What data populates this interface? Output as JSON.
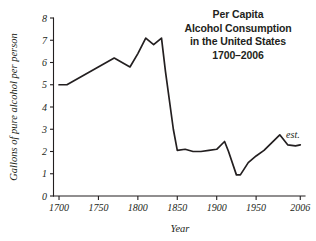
{
  "figure": {
    "width": 316,
    "height": 241,
    "background": "#ffffff",
    "ink_color": "#231f20"
  },
  "title": {
    "line1": "Per Capita",
    "line2": "Alcohol Consumption",
    "line3": "in the United States",
    "line4": "1700–2006"
  },
  "annotations": {
    "estimate_label": "est."
  },
  "chart_data": {
    "type": "line",
    "title": "Per Capita Alcohol Consumption in the United States 1700–2006",
    "xlabel": "Year",
    "ylabel": "Gallons of pure alcohol per person",
    "xlim": [
      1693,
      2012
    ],
    "ylim": [
      0,
      8
    ],
    "xticks": [
      1700,
      1750,
      1800,
      1850,
      1900,
      1950,
      2006
    ],
    "xtick_labels": [
      "1700",
      "1750",
      "1800",
      "1850",
      "1900",
      "1950",
      "2006"
    ],
    "yticks": [
      0,
      1,
      2,
      3,
      4,
      5,
      6,
      7,
      8
    ],
    "ytick_labels": [
      "0",
      "1",
      "2",
      "3",
      "4",
      "5",
      "6",
      "7",
      "8"
    ],
    "grid": false,
    "legend": "none",
    "series": [
      {
        "name": "Gallons of pure alcohol per person",
        "color": "#231f20",
        "x": [
          1700,
          1710,
          1770,
          1790,
          1800,
          1810,
          1820,
          1830,
          1835,
          1845,
          1850,
          1860,
          1870,
          1880,
          1890,
          1900,
          1910,
          1915,
          1925,
          1930,
          1940,
          1950,
          1960,
          1970,
          1980,
          1990,
          2000,
          2006
        ],
        "y": [
          5.0,
          5.0,
          6.2,
          5.8,
          6.4,
          7.1,
          6.8,
          7.1,
          5.6,
          3.0,
          2.05,
          2.1,
          2.0,
          2.0,
          2.05,
          2.1,
          2.45,
          2.0,
          0.95,
          0.95,
          1.5,
          1.8,
          2.05,
          2.4,
          2.75,
          2.3,
          2.25,
          2.3
        ]
      }
    ],
    "annotations": [
      {
        "text": "est.",
        "x": 1988,
        "y": 2.62
      }
    ]
  }
}
